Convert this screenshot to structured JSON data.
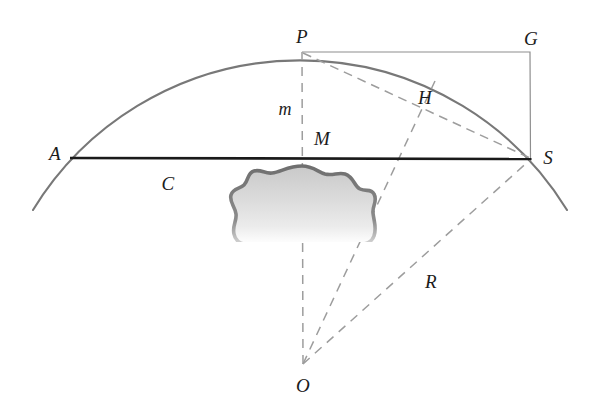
{
  "figure": {
    "type": "geometry-diagram",
    "background_color": "#ffffff",
    "labels": {
      "A": "A",
      "C": "C",
      "P": "P",
      "G": "G",
      "m": "m",
      "M": "M",
      "H": "H",
      "S": "S",
      "R": "R",
      "O": "O"
    },
    "colors": {
      "chord": "#1a1a1a",
      "arc": "#787878",
      "rectangle": "#8a8a8a",
      "dashed": "#9a9a9a",
      "blob_outline": "#7d7d7d",
      "blob_fill": "#d9d9d9",
      "label_text": "#1b1b1b"
    },
    "points": {
      "A": {
        "x": 70,
        "y": 158
      },
      "S": {
        "x": 531,
        "y": 159
      },
      "P": {
        "x": 302,
        "y": 52
      },
      "G": {
        "x": 530,
        "y": 52
      },
      "M": {
        "x": 302,
        "y": 158
      },
      "H": {
        "x": 420,
        "y": 110
      },
      "O": {
        "x": 303,
        "y": 365
      },
      "arc_start": {
        "x": 33,
        "y": 210
      },
      "arc_end": {
        "x": 567,
        "y": 210
      }
    },
    "label_positions": {
      "A": {
        "x": 55,
        "y": 153
      },
      "C": {
        "x": 168,
        "y": 183
      },
      "P": {
        "x": 302,
        "y": 36
      },
      "G": {
        "x": 531,
        "y": 38
      },
      "m": {
        "x": 285,
        "y": 109
      },
      "M": {
        "x": 322,
        "y": 138
      },
      "H": {
        "x": 425,
        "y": 97
      },
      "S": {
        "x": 548,
        "y": 157
      },
      "R": {
        "x": 431,
        "y": 281
      },
      "O": {
        "x": 303,
        "y": 385
      }
    },
    "geometry": {
      "circle_center": {
        "x": 303,
        "y": 365
      },
      "circle_radius": 313,
      "segments": [
        {
          "name": "chord-AS",
          "from": "A",
          "to": "S",
          "style": "solid-thick"
        },
        {
          "name": "radius-OP",
          "from": "O",
          "to": "P",
          "style": "dashed"
        },
        {
          "name": "radius-OS",
          "from": "O",
          "to": "S",
          "style": "dashed"
        },
        {
          "name": "radius-OH",
          "from": "O",
          "to": "H",
          "style": "dashed"
        },
        {
          "name": "chord-PS",
          "from": "P",
          "to": "S",
          "style": "dashed"
        },
        {
          "name": "rect-PG",
          "from": "P",
          "to": "G",
          "style": "solid-thin"
        },
        {
          "name": "rect-GS",
          "from": "G",
          "to": "S",
          "style": "solid-thin"
        }
      ]
    }
  }
}
